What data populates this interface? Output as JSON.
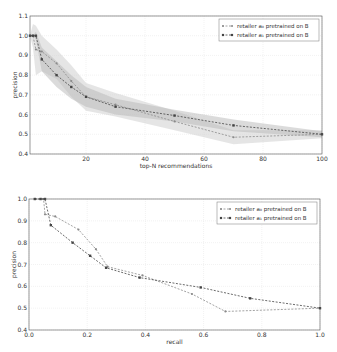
{
  "chart_data": [
    {
      "type": "line",
      "title": "",
      "xlabel": "top-N recommendations",
      "ylabel": "precision",
      "xlim": [
        1,
        100
      ],
      "ylim": [
        0.4,
        1.1
      ],
      "xticks": [
        20,
        40,
        60,
        80,
        100
      ],
      "yticks": [
        0.4,
        0.5,
        0.6,
        0.7,
        0.8,
        0.9,
        1.0,
        1.1
      ],
      "grid": true,
      "legend_position": "upper right",
      "x": [
        1,
        2,
        3,
        5,
        10,
        15,
        20,
        30,
        50,
        70,
        100
      ],
      "series": [
        {
          "name": "retailer a₀ pretrained on B",
          "color": "#8a8a8a",
          "marker": "x",
          "values": [
            1.0,
            1.0,
            0.93,
            0.92,
            0.86,
            0.77,
            0.69,
            0.65,
            0.565,
            0.485,
            0.5
          ],
          "band_upper": [
            1.0,
            1.06,
            1.05,
            1.0,
            0.93,
            0.85,
            0.76,
            0.71,
            0.62,
            0.52,
            0.52
          ],
          "band_lower": [
            1.0,
            0.94,
            0.8,
            0.82,
            0.78,
            0.69,
            0.62,
            0.59,
            0.52,
            0.45,
            0.48
          ]
        },
        {
          "name": "retailer a₁ pretrained on B",
          "color": "#444444",
          "marker": "square",
          "values": [
            1.0,
            1.0,
            1.0,
            0.88,
            0.8,
            0.74,
            0.69,
            0.64,
            0.595,
            0.545,
            0.5
          ],
          "band_upper": [
            1.0,
            1.0,
            1.02,
            0.94,
            0.87,
            0.8,
            0.74,
            0.68,
            0.625,
            0.575,
            0.515
          ],
          "band_lower": [
            1.0,
            1.0,
            0.98,
            0.82,
            0.74,
            0.68,
            0.64,
            0.6,
            0.565,
            0.515,
            0.485
          ]
        }
      ]
    },
    {
      "type": "line",
      "title": "",
      "xlabel": "recall",
      "ylabel": "precision",
      "xlim": [
        0.0,
        1.0
      ],
      "ylim": [
        0.4,
        1.0
      ],
      "xticks": [
        0.0,
        0.2,
        0.4,
        0.6,
        0.8,
        1.0
      ],
      "yticks": [
        0.4,
        0.5,
        0.6,
        0.7,
        0.8,
        0.9,
        1.0
      ],
      "grid": true,
      "legend_position": "upper right",
      "series": [
        {
          "name": "retailer a₀ pretrained on B",
          "color": "#8a8a8a",
          "marker": "x",
          "x": [
            0.02,
            0.05,
            0.055,
            0.09,
            0.17,
            0.23,
            0.27,
            0.39,
            0.56,
            0.675,
            1.0
          ],
          "y": [
            1.0,
            1.0,
            0.93,
            0.92,
            0.86,
            0.77,
            0.69,
            0.65,
            0.565,
            0.485,
            0.5
          ]
        },
        {
          "name": "retailer a₁ pretrained on B",
          "color": "#444444",
          "marker": "square",
          "x": [
            0.02,
            0.04,
            0.055,
            0.075,
            0.15,
            0.21,
            0.265,
            0.38,
            0.59,
            0.76,
            1.0
          ],
          "y": [
            1.0,
            1.0,
            1.0,
            0.88,
            0.8,
            0.74,
            0.685,
            0.64,
            0.595,
            0.545,
            0.5
          ]
        }
      ]
    }
  ]
}
